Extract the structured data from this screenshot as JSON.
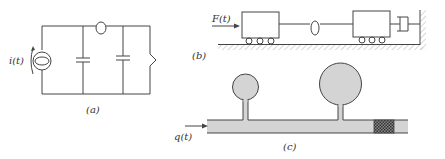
{
  "figure": {
    "panel_a": {
      "caption": "(a)",
      "source_label": "i(t)",
      "components": [
        "current-source",
        "inductor",
        "capacitor",
        "capacitor",
        "resistor"
      ]
    },
    "panel_b": {
      "caption": "(b)",
      "force_label": "F(t)",
      "components": [
        "mass-cart-1",
        "spring",
        "mass-cart-2",
        "damper",
        "wall"
      ]
    },
    "panel_c": {
      "caption": "(c)",
      "flow_label": "q(t)",
      "components": [
        "inlet-pipe",
        "small-tank",
        "large-tank",
        "porous-plug"
      ]
    }
  },
  "colors": {
    "line": "#444444",
    "fluid_fill": "#d4d4d4",
    "plug_fill": "#555555",
    "hatch": "#aaaaaa"
  }
}
